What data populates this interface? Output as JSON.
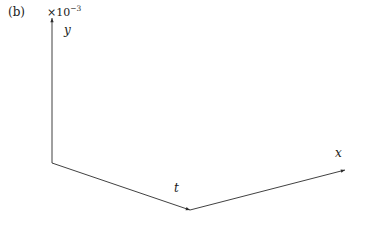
{
  "figure": {
    "panel_label": "(b)",
    "y_axis_exponent_prefix": "×10",
    "y_axis_exponent_power": "−3",
    "background_color": "#ffffff",
    "mesh_color": "#101010"
  },
  "axes": {
    "y": {
      "name": "y",
      "ticks": [
        "6",
        "5",
        "4",
        "3",
        "2",
        "1",
        "0",
        "−1"
      ],
      "min": -1,
      "max": 6,
      "scale": "×10⁻³"
    },
    "t": {
      "name": "t",
      "ticks": [
        "0",
        "20",
        "40",
        "60"
      ],
      "min": 0,
      "max": 60
    },
    "x": {
      "name": "x",
      "ticks": [
        "−20",
        "−10",
        "0",
        "10",
        "20"
      ],
      "min": -20,
      "max": 20
    }
  },
  "chart_data": {
    "type": "surface",
    "title": "",
    "xlabel": "x",
    "ylabel": "y",
    "zlabel": "t",
    "grid": false,
    "legend": "none",
    "xlim": [
      -20,
      20
    ],
    "tlim": [
      0,
      60
    ],
    "ylim": [
      -1,
      6
    ],
    "y_scale_factor": 0.001,
    "y_unit_exponent": -3,
    "x_samples": [
      -20,
      -18,
      -16,
      -14,
      -12,
      -10,
      -8,
      -6,
      -4,
      -2,
      0,
      2,
      4,
      6,
      8,
      10,
      12,
      14,
      16,
      18,
      20
    ],
    "t_samples": [
      0,
      4,
      8,
      12,
      16,
      20,
      24,
      28,
      32,
      36,
      40,
      44,
      48,
      52,
      56,
      60
    ],
    "peak": {
      "x": -5,
      "t": 20,
      "y": 6.0
    },
    "trough": {
      "x": 14,
      "t": 52,
      "y": -0.9
    },
    "surface_y_by_t": [
      {
        "t": 0,
        "values": [
          0.0,
          0.0,
          0.0,
          0.0,
          0.1,
          0.2,
          0.4,
          0.8,
          1.2,
          1.0,
          0.6,
          0.3,
          0.1,
          0.0,
          0.0,
          0.0,
          0.0,
          0.0,
          0.0,
          0.0,
          0.0
        ]
      },
      {
        "t": 4,
        "values": [
          0.0,
          0.0,
          0.0,
          0.1,
          0.2,
          0.5,
          1.0,
          1.8,
          2.4,
          1.9,
          1.1,
          0.5,
          0.2,
          0.0,
          0.0,
          0.0,
          0.0,
          0.0,
          0.0,
          0.0,
          0.0
        ]
      },
      {
        "t": 8,
        "values": [
          0.0,
          0.0,
          0.1,
          0.2,
          0.4,
          0.9,
          1.8,
          3.0,
          3.8,
          3.0,
          1.8,
          0.8,
          0.3,
          0.1,
          0.0,
          0.0,
          0.0,
          0.0,
          0.0,
          0.0,
          0.0
        ]
      },
      {
        "t": 12,
        "values": [
          0.0,
          0.0,
          0.1,
          0.3,
          0.7,
          1.4,
          2.6,
          4.2,
          5.2,
          4.1,
          2.4,
          1.0,
          0.4,
          0.1,
          0.0,
          0.0,
          0.0,
          0.0,
          0.0,
          0.0,
          0.0
        ]
      },
      {
        "t": 16,
        "values": [
          0.0,
          0.1,
          0.2,
          0.4,
          0.9,
          1.8,
          3.2,
          5.0,
          5.8,
          4.6,
          2.7,
          1.2,
          0.4,
          0.1,
          0.0,
          0.0,
          0.0,
          0.0,
          0.0,
          0.0,
          0.0
        ]
      },
      {
        "t": 20,
        "values": [
          0.0,
          0.1,
          0.2,
          0.5,
          1.0,
          1.9,
          3.4,
          5.3,
          6.0,
          4.7,
          2.8,
          1.2,
          0.5,
          0.1,
          0.0,
          0.0,
          0.0,
          0.0,
          0.0,
          0.0,
          0.0
        ]
      },
      {
        "t": 24,
        "values": [
          0.0,
          0.1,
          0.2,
          0.4,
          0.9,
          1.7,
          3.0,
          4.6,
          5.1,
          4.0,
          2.4,
          1.0,
          0.4,
          0.1,
          0.0,
          0.0,
          -0.1,
          -0.1,
          0.0,
          0.0,
          0.0
        ]
      },
      {
        "t": 28,
        "values": [
          0.0,
          0.1,
          0.2,
          0.4,
          0.8,
          1.5,
          2.6,
          3.9,
          4.2,
          3.3,
          2.0,
          0.9,
          0.3,
          0.0,
          -0.1,
          -0.2,
          -0.3,
          -0.2,
          -0.1,
          0.0,
          0.0
        ]
      },
      {
        "t": 32,
        "values": [
          0.0,
          0.1,
          0.2,
          0.3,
          0.7,
          1.3,
          2.2,
          3.2,
          3.4,
          2.7,
          1.6,
          0.7,
          0.2,
          -0.1,
          -0.3,
          -0.4,
          -0.5,
          -0.4,
          -0.2,
          0.0,
          0.0
        ]
      },
      {
        "t": 36,
        "values": [
          0.0,
          0.1,
          0.2,
          0.3,
          0.6,
          1.1,
          1.9,
          2.7,
          2.8,
          2.2,
          1.3,
          0.5,
          0.1,
          -0.2,
          -0.4,
          -0.6,
          -0.6,
          -0.5,
          -0.3,
          -0.1,
          0.0
        ]
      },
      {
        "t": 40,
        "values": [
          0.0,
          0.1,
          0.2,
          0.3,
          0.5,
          1.0,
          1.6,
          2.3,
          2.4,
          1.8,
          1.1,
          0.4,
          0.0,
          -0.3,
          -0.5,
          -0.7,
          -0.8,
          -0.6,
          -0.3,
          -0.1,
          0.0
        ]
      },
      {
        "t": 44,
        "values": [
          0.0,
          0.1,
          0.2,
          0.3,
          0.5,
          0.9,
          1.4,
          2.0,
          2.0,
          1.6,
          0.9,
          0.3,
          -0.1,
          -0.4,
          -0.6,
          -0.8,
          -0.8,
          -0.7,
          -0.4,
          -0.1,
          0.0
        ]
      },
      {
        "t": 48,
        "values": [
          0.0,
          0.1,
          0.2,
          0.3,
          0.4,
          0.8,
          1.2,
          1.7,
          1.8,
          1.4,
          0.8,
          0.2,
          -0.2,
          -0.4,
          -0.7,
          -0.9,
          -0.9,
          -0.7,
          -0.4,
          -0.1,
          0.0
        ]
      },
      {
        "t": 52,
        "values": [
          0.0,
          0.1,
          0.2,
          0.2,
          0.4,
          0.7,
          1.1,
          1.5,
          1.6,
          1.2,
          0.7,
          0.2,
          -0.2,
          -0.5,
          -0.7,
          -0.9,
          -0.9,
          -0.7,
          -0.4,
          -0.1,
          0.0
        ]
      },
      {
        "t": 56,
        "values": [
          0.0,
          0.1,
          0.1,
          0.2,
          0.4,
          0.6,
          1.0,
          1.4,
          1.4,
          1.1,
          0.6,
          0.1,
          -0.2,
          -0.5,
          -0.7,
          -0.8,
          -0.8,
          -0.6,
          -0.3,
          -0.1,
          0.0
        ]
      },
      {
        "t": 60,
        "values": [
          0.0,
          0.1,
          0.1,
          0.2,
          0.3,
          0.6,
          0.9,
          1.2,
          1.3,
          1.0,
          0.6,
          0.1,
          -0.2,
          -0.4,
          -0.6,
          -0.8,
          -0.8,
          -0.6,
          -0.3,
          -0.1,
          0.0
        ]
      }
    ]
  }
}
